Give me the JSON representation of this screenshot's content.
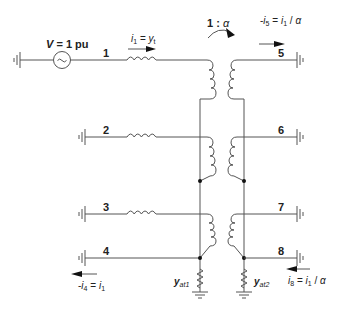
{
  "diagram": {
    "type": "circuit-schematic",
    "colors": {
      "wire": "#555555",
      "text": "#222222",
      "background": "#ffffff"
    },
    "source": {
      "label_var": "V",
      "label_rest": " = 1 pu",
      "symbol": "~"
    },
    "transformer_ratio": {
      "left": "1 : ",
      "alpha": "α"
    },
    "buses": [
      {
        "id": "1",
        "label": "1"
      },
      {
        "id": "2",
        "label": "2"
      },
      {
        "id": "3",
        "label": "3"
      },
      {
        "id": "4",
        "label": "4"
      },
      {
        "id": "5",
        "label": "5"
      },
      {
        "id": "6",
        "label": "6"
      },
      {
        "id": "7",
        "label": "7"
      },
      {
        "id": "8",
        "label": "8"
      }
    ],
    "currents": {
      "i1": {
        "lhs_var": "i",
        "lhs_sub": "1",
        "eq": " = ",
        "rhs_var": "y",
        "rhs_sub": "t"
      },
      "i5": {
        "neg": "-",
        "lhs_var": "i",
        "lhs_sub": "5",
        "eq": " = ",
        "rhs_var": "i",
        "rhs_sub": "1",
        "div": " / ",
        "alpha": "α"
      },
      "i4": {
        "neg": "-",
        "lhs_var": "i",
        "lhs_sub": "4",
        "eq": " = ",
        "rhs_var": "i",
        "rhs_sub": "1"
      },
      "i8": {
        "lhs_var": "i",
        "lhs_sub": "8",
        "eq": " = ",
        "rhs_var": "i",
        "rhs_sub": "1",
        "div": " / ",
        "alpha": "α"
      }
    },
    "admittances": {
      "yat1": {
        "var": "y",
        "sub": "at1"
      },
      "yat2": {
        "var": "y",
        "sub": "at2"
      }
    }
  }
}
